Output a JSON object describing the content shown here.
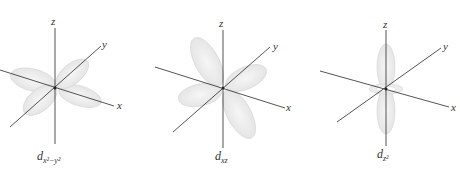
{
  "figure": {
    "panels": [
      {
        "name": "dx2-y2",
        "axes": {
          "z": "z",
          "y": "y",
          "x": "x"
        },
        "caption": {
          "base": "d",
          "subscript": "x²−y²"
        }
      },
      {
        "name": "dxz",
        "axes": {
          "z": "z",
          "y": "y",
          "x": "x"
        },
        "caption": {
          "base": "d",
          "subscript": "xz"
        }
      },
      {
        "name": "dz2",
        "axes": {
          "z": "z",
          "y": "y",
          "x": "x"
        },
        "caption": {
          "base": "d",
          "subscript": "z²"
        }
      }
    ],
    "colors": {
      "axis": "#2a2a2a",
      "lobe_fill": "#e9e9e9",
      "lobe_edge": "#d4d4d4"
    }
  }
}
